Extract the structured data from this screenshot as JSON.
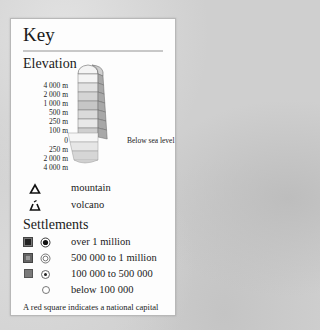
{
  "key": {
    "title": "Key",
    "elevation": {
      "heading": "Elevation",
      "above_levels": [
        "4 000 m",
        "2 000 m",
        "1 000 m",
        "500 m",
        "250 m",
        "100 m",
        "0"
      ],
      "below_levels": [
        "250 m",
        "2 000 m",
        "4 000 m"
      ],
      "below_sea_label": "Below sea level",
      "colors_above": [
        "#f4f4f4",
        "#e2e2e2",
        "#d4d4d4",
        "#c6c6c6",
        "#dadada",
        "#e8e8e8",
        "#cfcfcf"
      ],
      "colors_below": [
        "#f6f6f6",
        "#e6e6e6",
        "#d6d6d6"
      ]
    },
    "features": [
      {
        "icon": "mountain-icon",
        "label": "mountain"
      },
      {
        "icon": "volcano-icon",
        "label": "volcano"
      }
    ],
    "settlements": {
      "heading": "Settlements",
      "items": [
        {
          "label": "over 1 million",
          "square": true,
          "square_color": "#333333",
          "circle": "dot-ring"
        },
        {
          "label": "500 000 to 1 million",
          "square": true,
          "square_color": "#555555",
          "circle": "double-ring"
        },
        {
          "label": "100 000 to 500 000",
          "square": true,
          "square_color": "#777777",
          "circle": "small-dot-ring"
        },
        {
          "label": "below 100 000",
          "square": false,
          "circle": "ring"
        }
      ],
      "note": "A red square indicates a national capital"
    }
  }
}
